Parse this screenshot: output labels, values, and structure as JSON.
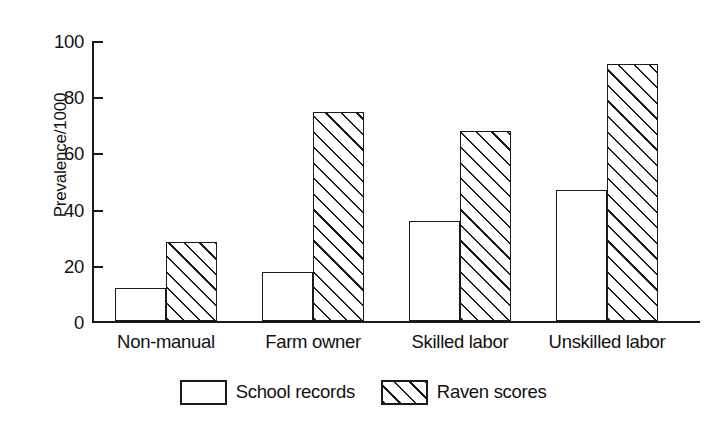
{
  "chart_data": {
    "type": "bar",
    "title": "",
    "subtitle": "",
    "xlabel": "",
    "ylabel": "Prevalence/1000",
    "categories": [
      "Non-manual",
      "Farm owner",
      "Skilled labor",
      "Unskilled labor"
    ],
    "series": [
      {
        "name": "School records",
        "fill": "white",
        "values": [
          12,
          17.5,
          36,
          47
        ]
      },
      {
        "name": "Raven scores",
        "fill": "hatched",
        "values": [
          28.5,
          75,
          68,
          92
        ]
      }
    ],
    "ylim": [
      0,
      100
    ],
    "yticks": [
      0,
      20,
      40,
      60,
      80,
      100
    ],
    "ytick_labels": [
      "0",
      "20",
      "40",
      "60",
      "80",
      "100"
    ],
    "grid": false,
    "legend_position": "bottom-center",
    "colors": {
      "axis": "#1a1a1a",
      "bar_outline": "#1a1a1a",
      "bar_fill": "#ffffff",
      "hatch": "#1a1a1a",
      "background": "#ffffff",
      "text": "#111111"
    }
  },
  "legend": {
    "items": [
      {
        "label": "School records",
        "pattern": "solid-white"
      },
      {
        "label": "Raven scores",
        "pattern": "diagonal-hatch"
      }
    ]
  }
}
